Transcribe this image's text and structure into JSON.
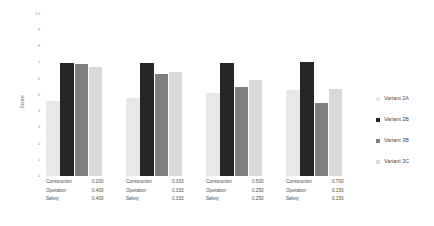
{
  "chart_data": {
    "type": "bar",
    "title": "",
    "xlabel": "",
    "ylabel": "Score",
    "ylim": [
      0,
      10
    ],
    "grid": false,
    "legend_position": "right",
    "categories": [
      "Group 1",
      "Group 2",
      "Group 3",
      "Group 4"
    ],
    "weight_criteria": [
      "Construction",
      "Operation",
      "Safety"
    ],
    "weights": [
      [
        "0.200",
        "0.400",
        "0.400"
      ],
      [
        "0.333",
        "0.333",
        "0.333"
      ],
      [
        "0.500",
        "0.250",
        "0.250"
      ],
      [
        "0.700",
        "0.150",
        "0.150"
      ]
    ],
    "series": [
      {
        "name": "Variant 2A",
        "color": "#e8e8e8",
        "values": [
          4.6,
          4.8,
          5.1,
          5.3
        ]
      },
      {
        "name": "Variant 2B",
        "color": "#262626",
        "values": [
          7.0,
          7.0,
          7.0,
          7.05
        ]
      },
      {
        "name": "Variant 3B",
        "color": "#808080",
        "values": [
          6.9,
          6.3,
          5.5,
          4.5
        ]
      },
      {
        "name": "Variant 3C",
        "color": "#d9d9d9",
        "values": [
          6.7,
          6.4,
          5.9,
          5.4
        ]
      }
    ],
    "y_ticks": [
      "10",
      "9",
      "8",
      "7",
      "6",
      "5",
      "4",
      "3",
      "2",
      "1",
      "0"
    ]
  },
  "axis": {
    "y_title": "Score"
  },
  "legend": {
    "items": [
      {
        "label": "Variant 2A"
      },
      {
        "label": "Variant 2B"
      },
      {
        "label": "Variant 3B"
      },
      {
        "label": "Variant 3C"
      }
    ]
  }
}
